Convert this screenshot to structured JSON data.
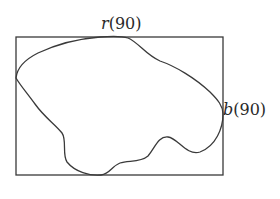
{
  "diagram": {
    "labels": {
      "top": {
        "symbol": "r",
        "arg": "(90)"
      },
      "right": {
        "symbol": "b",
        "arg": "(90)"
      }
    },
    "rectangle": {
      "x": 16,
      "y": 37,
      "width": 207,
      "height": 138
    },
    "colors": {
      "stroke": "#3a3a3a",
      "background": "#ffffff"
    }
  }
}
